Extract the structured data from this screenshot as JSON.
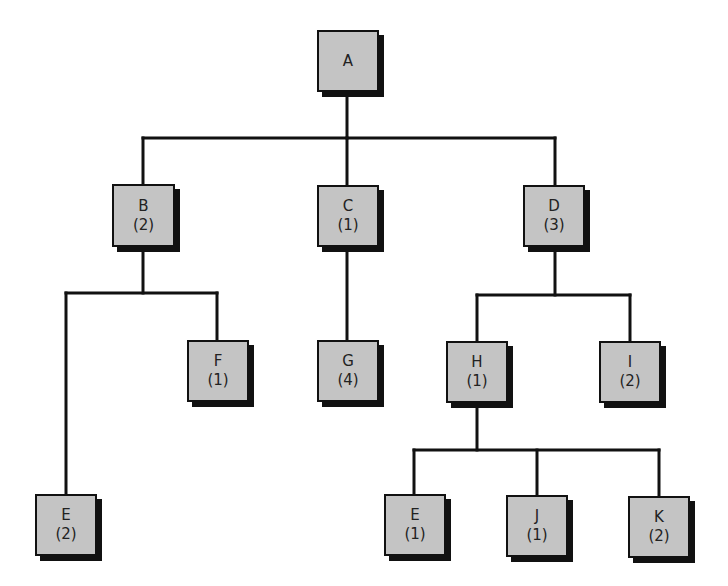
{
  "diagram": {
    "type": "tree",
    "colors": {
      "node_fill": "#c4c4c4",
      "line": "#111111",
      "shadow": "#111111",
      "background": "#ffffff"
    },
    "nodes": {
      "A": {
        "label": "A",
        "count": ""
      },
      "B": {
        "label": "B",
        "count": "(2)"
      },
      "C": {
        "label": "C",
        "count": "(1)"
      },
      "D": {
        "label": "D",
        "count": "(3)"
      },
      "E1": {
        "label": "E",
        "count": "(2)"
      },
      "F": {
        "label": "F",
        "count": "(1)"
      },
      "G": {
        "label": "G",
        "count": "(4)"
      },
      "H": {
        "label": "H",
        "count": "(1)"
      },
      "I": {
        "label": "I",
        "count": "(2)"
      },
      "E2": {
        "label": "E",
        "count": "(1)"
      },
      "J": {
        "label": "J",
        "count": "(1)"
      },
      "K": {
        "label": "K",
        "count": "(2)"
      }
    },
    "edges": [
      [
        "A",
        "B"
      ],
      [
        "A",
        "C"
      ],
      [
        "A",
        "D"
      ],
      [
        "B",
        "E1"
      ],
      [
        "B",
        "F"
      ],
      [
        "C",
        "G"
      ],
      [
        "D",
        "H"
      ],
      [
        "D",
        "I"
      ],
      [
        "H",
        "E2"
      ],
      [
        "H",
        "J"
      ],
      [
        "H",
        "K"
      ]
    ]
  }
}
